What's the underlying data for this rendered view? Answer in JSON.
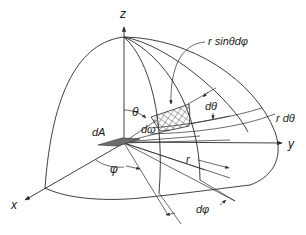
{
  "diagram": {
    "labels": {
      "z_axis": "z",
      "y_axis": "y",
      "x_axis": "x",
      "theta": "θ",
      "phi": "φ",
      "d_omega": "dω",
      "d_theta": "dθ",
      "d_phi": "dφ",
      "dA": "dA",
      "r": "r",
      "r_sin_theta_d_phi": "r sinθdφ",
      "r_d_theta": "r dθ"
    },
    "colors": {
      "line": "#2a2a2a",
      "surface_element": "#6e6e6e",
      "background": "#ffffff"
    }
  }
}
